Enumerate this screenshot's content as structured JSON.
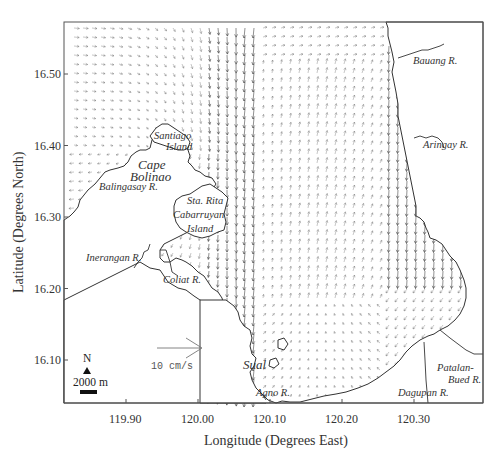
{
  "figure": {
    "x_axis_title": "Longitude (Degrees East)",
    "y_axis_title": "Latitude (Degrees North)",
    "x_ticks": [
      {
        "label": "119.90",
        "value": 119.9
      },
      {
        "label": "120.00",
        "value": 120.0
      },
      {
        "label": "120.10",
        "value": 120.1
      },
      {
        "label": "120.20",
        "value": 120.2
      },
      {
        "label": "120.30",
        "value": 120.3
      }
    ],
    "y_ticks": [
      {
        "label": "16.50",
        "value": 16.5
      },
      {
        "label": "16.40",
        "value": 16.4
      },
      {
        "label": "16.30",
        "value": 16.3
      },
      {
        "label": "16.20",
        "value": 16.2
      },
      {
        "label": "16.10",
        "value": 16.1
      }
    ],
    "frame": {
      "left": 64,
      "top": 22,
      "right": 483,
      "bottom": 403
    },
    "colors": {
      "frame": "#555555",
      "coast": "#333333",
      "vector": "#444444",
      "land": "#ffffff"
    }
  },
  "legend": {
    "north_label": "N",
    "scale_bar_label": "2000 m",
    "reference_vector_label": "10 cm/s"
  },
  "place_labels": {
    "santiago": "Santiago",
    "santiago_island": "Island",
    "cape": "Cape",
    "bolinao": "Bolinao",
    "balingasay": "Balingasay R.",
    "sta_rita": "Sta. Rita",
    "cabarruyan": "Cabarruyan",
    "cabarruyan_island": "Island",
    "inerangan": "Inerangan R.",
    "coliat": "Coliat R.",
    "bauang": "Bauang R.",
    "aringay": "Aringay R.",
    "sual": "Sual",
    "agno": "Agno R.",
    "dagupan": "Dagupan R.",
    "patalan": "Patalan-",
    "bued": "Bued R."
  },
  "chart_data": {
    "type": "vector_field_map",
    "title": "",
    "xlabel": "Longitude (Degrees East)",
    "ylabel": "Latitude (Degrees North)",
    "xlim": [
      119.82,
      120.4
    ],
    "ylim": [
      16.04,
      16.57
    ],
    "x_ticks": [
      119.9,
      120.0,
      120.1,
      120.2,
      120.3
    ],
    "y_ticks": [
      16.1,
      16.2,
      16.3,
      16.4,
      16.5
    ],
    "grid": false,
    "reference_vector": {
      "speed_cm_s": 10,
      "label": "10 cm/s"
    },
    "scale_bar": {
      "length_m": 2000,
      "label": "2000 m"
    },
    "north_arrow": true,
    "flow_description": [
      {
        "region": "northwest Lingayen Gulf mouth (west)",
        "direction": "east to southeast, curving south",
        "magnitude": "weak to moderate"
      },
      {
        "region": "western gulf column near 120.05-120.08 E",
        "direction": "south / southwest",
        "magnitude": "strong"
      },
      {
        "region": "central gulf 120.10-120.25 E",
        "direction": "north / north-northeast",
        "magnitude": "weak"
      },
      {
        "region": "eastern coast near 120.30-120.33 E",
        "direction": "south",
        "magnitude": "strong"
      },
      {
        "region": "southern gulf",
        "direction": "cyclonic recirculation (west along south coast, north in center)",
        "magnitude": "weak"
      }
    ],
    "annotations": [
      "Santiago Island",
      "Cape Bolinao",
      "Balingasay R.",
      "Sta. Rita",
      "Cabarruyan Island",
      "Inerangan R.",
      "Coliat R.",
      "Bauang R.",
      "Aringay R.",
      "Sual",
      "Agno R.",
      "Dagupan R.",
      "Patalan-Bued R."
    ]
  }
}
